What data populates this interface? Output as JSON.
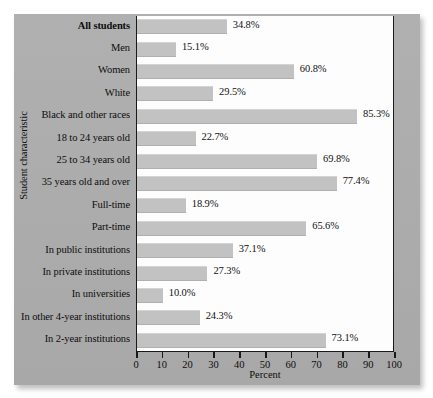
{
  "chart_data": {
    "type": "bar",
    "orientation": "horizontal",
    "title": "",
    "xlabel": "Percent",
    "ylabel": "Student characteristic",
    "xlim": [
      0,
      100
    ],
    "xticks": [
      0,
      10,
      20,
      30,
      40,
      50,
      60,
      70,
      80,
      90,
      100
    ],
    "grid": false,
    "legend": null,
    "bar_color": "#c2c2c2",
    "panel_color": "#aaaaaa",
    "categories": [
      "All students",
      "Men",
      "Women",
      "White",
      "Black and other races",
      "18 to 24 years old",
      "25 to 34 years old",
      "35 years old and over",
      "Full-time",
      "Part-time",
      "In public institutions",
      "In private institutions",
      "In universities",
      "In other 4-year institutions",
      "In 2-year institutions"
    ],
    "values": [
      34.8,
      15.1,
      60.8,
      29.5,
      85.3,
      22.7,
      69.8,
      77.4,
      18.9,
      65.6,
      37.1,
      27.3,
      10.0,
      24.3,
      73.1
    ],
    "value_labels": [
      "34.8%",
      "15.1%",
      "60.8%",
      "29.5%",
      "85.3%",
      "22.7%",
      "69.8%",
      "77.4%",
      "18.9%",
      "65.6%",
      "37.1%",
      "27.3%",
      "10.0%",
      "24.3%",
      "73.1%"
    ],
    "emphasized_categories": [
      "All students"
    ]
  }
}
